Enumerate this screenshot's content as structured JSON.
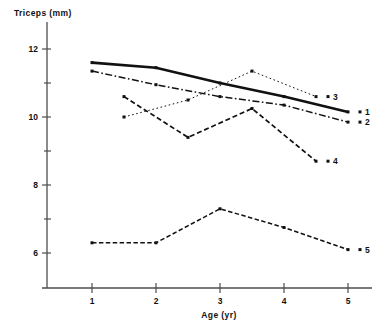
{
  "chart_data": {
    "type": "line",
    "title": "",
    "xlabel": "Age (yr)",
    "ylabel": "Triceps (mm)",
    "xlim": [
      0.5,
      5.6
    ],
    "ylim": [
      5.4,
      12.45
    ],
    "grid": false,
    "legend": "right-end-of-line-labels",
    "x_ticks": [
      1,
      2,
      3,
      4,
      5
    ],
    "x_tick_labels": [
      "1",
      "2",
      "3",
      "4",
      "5"
    ],
    "y_ticks": [
      6,
      7,
      8,
      9,
      10,
      11,
      12
    ],
    "y_tick_labels": [
      "6",
      "",
      "8",
      "",
      "10",
      "",
      "12"
    ],
    "y_major_ticks": [
      6,
      8,
      10,
      12
    ],
    "y_minor_ticks": [
      7,
      9,
      11
    ],
    "series": [
      {
        "name": "1",
        "label": "1",
        "style": "solid-thick",
        "x": [
          1,
          2,
          3,
          4,
          5
        ],
        "values": [
          11.6,
          11.45,
          11.0,
          10.6,
          10.15
        ]
      },
      {
        "name": "2",
        "label": "2",
        "style": "dash-dot",
        "x": [
          1,
          2,
          3,
          4,
          5
        ],
        "values": [
          11.35,
          10.95,
          10.6,
          10.35,
          9.85
        ]
      },
      {
        "name": "3",
        "label": "3",
        "style": "dotted",
        "x": [
          1.5,
          2.5,
          3.5,
          4.5
        ],
        "values": [
          10.0,
          10.5,
          11.35,
          10.6
        ]
      },
      {
        "name": "4",
        "label": "4",
        "style": "dashed",
        "x": [
          1.5,
          2.5,
          3.5,
          4.5
        ],
        "values": [
          10.6,
          9.4,
          10.25,
          8.7
        ]
      },
      {
        "name": "5",
        "label": "5",
        "style": "dashed-fine",
        "x": [
          1,
          2,
          3,
          4,
          5
        ],
        "values": [
          6.3,
          6.3,
          7.3,
          6.75,
          6.1
        ]
      }
    ]
  }
}
